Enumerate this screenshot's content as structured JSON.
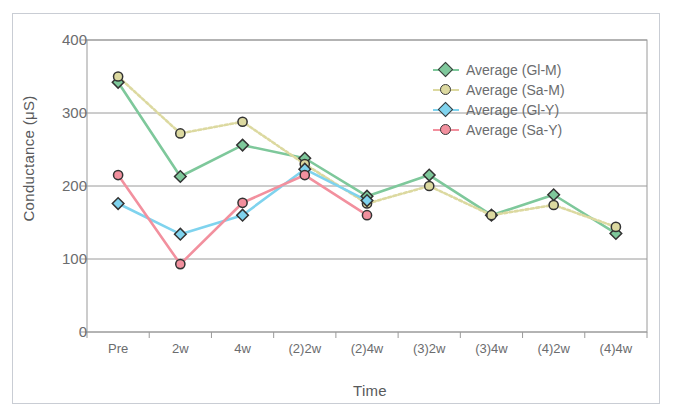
{
  "chart_data": {
    "type": "line",
    "title": "",
    "xlabel": "Time",
    "ylabel": "Conductance (μS)",
    "ylim": [
      0,
      400
    ],
    "yticks": [
      0,
      100,
      200,
      300,
      400
    ],
    "grid": "horizontal",
    "legend_position": "top-right",
    "categories": [
      "Pre",
      "2w",
      "4w",
      "(2)2w",
      "(2)4w",
      "(3)2w",
      "(3)4w",
      "(4)2w",
      "(4)4w"
    ],
    "series": [
      {
        "name": "Average (Gl-M)",
        "color": "#7ec89b",
        "marker": "diamond",
        "linestyle": "solid",
        "values": [
          342,
          213,
          256,
          238,
          186,
          215,
          160,
          188,
          135
        ]
      },
      {
        "name": "Average (Sa-M)",
        "color": "#dcd9a0",
        "marker": "circle",
        "linestyle": "dotted",
        "values": [
          350,
          272,
          288,
          230,
          176,
          200,
          160,
          174,
          144
        ]
      },
      {
        "name": "Average (Gl-Y)",
        "color": "#7fd3ee",
        "marker": "diamond",
        "linestyle": "solid",
        "values": [
          176,
          134,
          160,
          223,
          180,
          null,
          null,
          null,
          null
        ]
      },
      {
        "name": "Average (Sa-Y)",
        "color": "#f2909e",
        "marker": "circle",
        "linestyle": "solid",
        "values": [
          215,
          93,
          177,
          215,
          160,
          null,
          null,
          null,
          null
        ]
      }
    ]
  },
  "axes": {
    "y_axis_label": "Conductance (μS)",
    "x_axis_label": "Time",
    "y_tick_labels": [
      "400",
      "300",
      "200",
      "100",
      "0"
    ],
    "x_tick_labels": [
      "Pre",
      "2w",
      "4w",
      "(2)2w",
      "(2)4w",
      "(3)2w",
      "(3)4w",
      "(4)2w",
      "(4)4w"
    ]
  },
  "legend": {
    "entries": [
      {
        "label": "Average  (Gl-M)",
        "color": "#7ec89b",
        "marker": "diamond"
      },
      {
        "label": "Average  (Sa-M)",
        "color": "#dcd9a0",
        "marker": "circle"
      },
      {
        "label": "Average  (Gl-Y)",
        "color": "#7fd3ee",
        "marker": "diamond"
      },
      {
        "label": "Average  (Sa-Y)",
        "color": "#f2909e",
        "marker": "circle"
      }
    ]
  },
  "colors": {
    "frame": "#c9cdd4",
    "grid": "#9a9a9a",
    "text": "#6b6c6e",
    "background": "#ffffff"
  }
}
